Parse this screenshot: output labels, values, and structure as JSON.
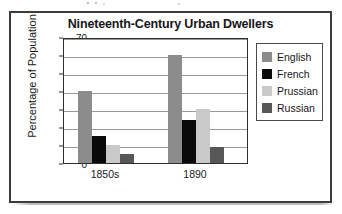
{
  "chart_data": {
    "type": "bar",
    "title": "Nineteenth-Century Urban Dwellers",
    "xlabel": "",
    "ylabel": "Percentage of Population",
    "categories": [
      "1850s",
      "1890"
    ],
    "series": [
      {
        "name": "English",
        "color": "#8c8c8c",
        "values": [
          40,
          60
        ]
      },
      {
        "name": "French",
        "color": "#0a0a0a",
        "values": [
          15,
          24
        ]
      },
      {
        "name": "Prussian",
        "color": "#c9c9c9",
        "values": [
          10,
          30
        ]
      },
      {
        "name": "Russian",
        "color": "#575757",
        "values": [
          5,
          9
        ]
      }
    ],
    "ylim": [
      0,
      70
    ],
    "ytick_values": [
      0,
      10,
      20,
      30,
      40,
      50,
      60,
      70
    ],
    "ytick_labels": [
      "0",
      "10",
      "20",
      "30",
      "40",
      "50",
      "60",
      "70"
    ],
    "grid": true,
    "legend_position": "right"
  }
}
